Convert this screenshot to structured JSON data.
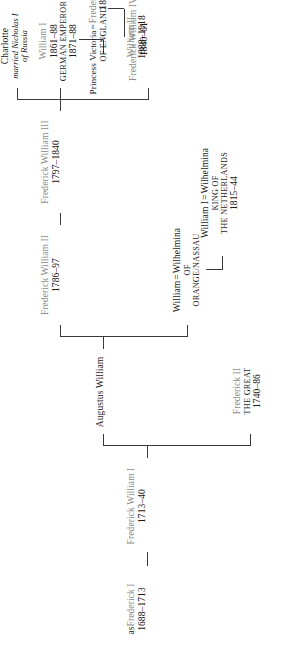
{
  "diagram": {
    "type": "genealogy-tree",
    "line_color": "#3a3a3a",
    "name_color": "#8c8c8c",
    "date_color": "#1a1a1a"
  },
  "nodes": {
    "frederick_i": {
      "prefix": "as",
      "name": "Frederick I",
      "dates": "1688–1713"
    },
    "frederick_william_i": {
      "name": "Frederick William I",
      "dates": "1713–40"
    },
    "augustus_william": {
      "name": "Augustus William"
    },
    "frederick_ii": {
      "name": "Frederick II",
      "epithet": "The Great",
      "dates": "1740–86"
    },
    "william_wilhelmina": {
      "left": "William",
      "marriage": "=",
      "right": "Wilhelmina",
      "of": "of",
      "house": "Orange/Nassau"
    },
    "william_i_netherlands": {
      "left": "William I",
      "marriage": "=",
      "right": "Wilhelmina",
      "title1": "King of",
      "title2": "the Netherlands",
      "dates": "1815–44"
    },
    "frederick_william_ii": {
      "name": "Frederick William II",
      "dates": "1786–97"
    },
    "frederick_william_iii": {
      "name": "Frederick William III",
      "dates": "1797–1840"
    },
    "frederick_william_iv": {
      "name": "Frederick William IV",
      "dates": "1840–61"
    },
    "william_i_german": {
      "name": "William I",
      "dates": "1861–88",
      "title": "German Emperor",
      "title_dates": "1871–88"
    },
    "charlotte": {
      "name": "Charlotte",
      "note1": "married Nicholas I",
      "note2": "of Russia"
    },
    "victoria_frederick_iii": {
      "left": "Princess Victoria",
      "left_sub": "of England",
      "marriage": "=",
      "right": "Frederick III",
      "right_dates": "1888"
    },
    "william_ii": {
      "name": "William II",
      "dates": "1888–1918"
    }
  }
}
